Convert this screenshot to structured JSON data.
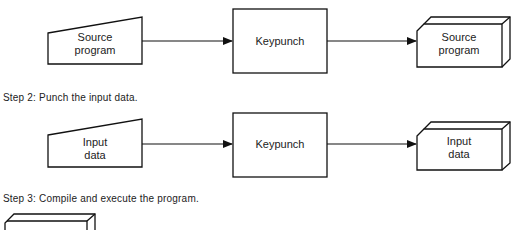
{
  "diagram": {
    "type": "flowchart",
    "rows": [
      {
        "step_label": null,
        "source": {
          "shape": "manual-input",
          "label_line1": "Source",
          "label_line2": "program"
        },
        "process": {
          "shape": "rectangle",
          "label": "Keypunch"
        },
        "output": {
          "shape": "card-deck",
          "label_line1": "Source",
          "label_line2": "program"
        }
      },
      {
        "step_label": "Step 2: Punch the input data.",
        "source": {
          "shape": "manual-input",
          "label_line1": "Input",
          "label_line2": "data"
        },
        "process": {
          "shape": "rectangle",
          "label": "Keypunch"
        },
        "output": {
          "shape": "card-deck",
          "label_line1": "Input",
          "label_line2": "data"
        }
      },
      {
        "step_label": "Step 3: Compile and execute the program.",
        "partial_shape": "card-deck"
      }
    ],
    "edges": [
      {
        "from": "row0.source",
        "to": "row0.process"
      },
      {
        "from": "row0.process",
        "to": "row0.output"
      },
      {
        "from": "row1.source",
        "to": "row1.process"
      },
      {
        "from": "row1.process",
        "to": "row1.output"
      }
    ]
  }
}
